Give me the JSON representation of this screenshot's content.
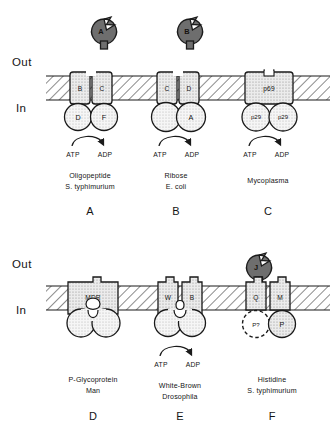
{
  "figure": {
    "side_labels": {
      "out": "Out",
      "in": "In"
    },
    "nucleotides": {
      "atp": "ATP",
      "adp": "ADP"
    },
    "colors": {
      "blob_fill": "#6e6e6e",
      "blob_stroke": "#1b1b1b",
      "membrane_fill": "#ffffff",
      "membrane_hatch": "#2a2a2a",
      "subunit_fill": "#dedede",
      "circle_fill": "#f4f4f4",
      "shaded_circle_fill": "#d9d9d9",
      "line": "#1a1a1a",
      "text": "#141414"
    },
    "panels": [
      {
        "id": "A",
        "panel_label": "A",
        "caption_lines": [
          "Oligopeptide",
          "S. typhimurium"
        ],
        "binding_protein": {
          "label": "A",
          "present": true
        },
        "membrane_subunits": [
          {
            "label": "B"
          },
          {
            "label": "C"
          }
        ],
        "cytoplasmic_subunits": [
          {
            "label": "D",
            "style": "circle"
          },
          {
            "label": "F",
            "style": "circle"
          }
        ],
        "atp_arrow": true
      },
      {
        "id": "B",
        "panel_label": "B",
        "caption_lines": [
          "Ribose",
          "E. coli"
        ],
        "binding_protein": {
          "label": "B",
          "present": true
        },
        "membrane_subunits": [
          {
            "label": "C"
          },
          {
            "label": "D"
          }
        ],
        "cytoplasmic_subunits": [
          {
            "label": "",
            "style": "circle"
          },
          {
            "label": "A",
            "style": "circle"
          }
        ],
        "atp_arrow": true
      },
      {
        "id": "C",
        "panel_label": "C",
        "caption_lines": [
          "Mycoplasma"
        ],
        "binding_protein": {
          "label": "",
          "present": false
        },
        "membrane_subunits": [
          {
            "label": "p69",
            "wide": true
          }
        ],
        "cytoplasmic_subunits": [
          {
            "label": "p29",
            "style": "circle"
          },
          {
            "label": "p29",
            "style": "circle"
          }
        ],
        "atp_arrow": true
      },
      {
        "id": "D",
        "panel_label": "D",
        "caption_lines": [
          "P-Glycoprotein",
          "Man"
        ],
        "binding_protein": {
          "label": "",
          "present": false
        },
        "membrane_subunits": [
          {
            "label": "MDR",
            "fused": true
          }
        ],
        "cytoplasmic_subunits": [
          {
            "label": "",
            "style": "lobe"
          },
          {
            "label": "",
            "style": "lobe"
          }
        ],
        "atp_arrow": false
      },
      {
        "id": "E",
        "panel_label": "E",
        "caption_lines": [
          "White-Brown",
          "Drosophila"
        ],
        "binding_protein": {
          "label": "",
          "present": false
        },
        "membrane_subunits": [
          {
            "label": "W"
          },
          {
            "label": "B"
          }
        ],
        "cytoplasmic_subunits": [
          {
            "label": "",
            "style": "lobe"
          },
          {
            "label": "",
            "style": "lobe"
          }
        ],
        "atp_arrow": true
      },
      {
        "id": "F",
        "panel_label": "F",
        "caption_lines": [
          "Histidine",
          "S. typhimurium"
        ],
        "binding_protein": {
          "label": "J",
          "present": true
        },
        "membrane_subunits": [
          {
            "label": "Q"
          },
          {
            "label": "M"
          }
        ],
        "cytoplasmic_subunits": [
          {
            "label": "P?",
            "style": "dashed-circle"
          },
          {
            "label": "P",
            "style": "shaded-circle"
          }
        ],
        "atp_arrow": false
      }
    ]
  }
}
